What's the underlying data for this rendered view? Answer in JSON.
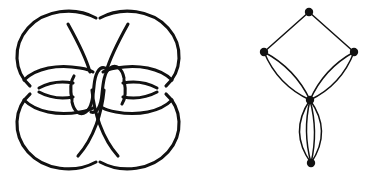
{
  "figure": {
    "background_color": "#ffffff",
    "stroke_color": "#111111",
    "width": 382,
    "height": 180
  },
  "knot_panel": {
    "label": "knot-diagram",
    "description": "Alternating knot projection with four outer lobes, two horizontal lens arcs and a central S-curve",
    "line_width": 3.1,
    "crossing_count": 10,
    "components": [
      {
        "name": "top-left-lobe",
        "type": "arc"
      },
      {
        "name": "top-right-lobe",
        "type": "arc"
      },
      {
        "name": "bottom-left-lobe",
        "type": "arc"
      },
      {
        "name": "bottom-right-lobe",
        "type": "arc"
      },
      {
        "name": "left-lens",
        "type": "lens"
      },
      {
        "name": "right-lens",
        "type": "lens"
      },
      {
        "name": "center-s-curve",
        "type": "clasp"
      }
    ]
  },
  "graph_panel": {
    "label": "planar-graph",
    "description": "Five-vertex multigraph: diamond of four vertices over a bottom vertex joined by four parallel edges",
    "node_radius": 4.2,
    "edge_width": 1.5,
    "nodes": [
      {
        "id": "top",
        "name": "node-top",
        "x": 114,
        "y": 12,
        "label": ""
      },
      {
        "id": "left",
        "name": "node-left",
        "x": 69,
        "y": 52,
        "label": ""
      },
      {
        "id": "right",
        "name": "node-right",
        "x": 159,
        "y": 52,
        "label": ""
      },
      {
        "id": "center",
        "name": "node-center",
        "x": 115,
        "y": 100,
        "label": ""
      },
      {
        "id": "bottom",
        "name": "node-bottom",
        "x": 116,
        "y": 163,
        "label": ""
      }
    ],
    "edges": [
      {
        "from": "top",
        "to": "left",
        "curvature": 0,
        "name": "edge-top-left"
      },
      {
        "from": "top",
        "to": "right",
        "curvature": 0,
        "name": "edge-top-right"
      },
      {
        "from": "left",
        "to": "center",
        "curvature": 13,
        "name": "edge-left-center-outer"
      },
      {
        "from": "left",
        "to": "center",
        "curvature": -11,
        "name": "edge-left-center-inner"
      },
      {
        "from": "right",
        "to": "center",
        "curvature": -13,
        "name": "edge-right-center-outer"
      },
      {
        "from": "right",
        "to": "center",
        "curvature": 11,
        "name": "edge-right-center-inner"
      },
      {
        "from": "center",
        "to": "bottom",
        "curvature": 22,
        "name": "edge-center-bottom-1"
      },
      {
        "from": "center",
        "to": "bottom",
        "curvature": 8,
        "name": "edge-center-bottom-2"
      },
      {
        "from": "center",
        "to": "bottom",
        "curvature": -8,
        "name": "edge-center-bottom-3"
      },
      {
        "from": "center",
        "to": "bottom",
        "curvature": -22,
        "name": "edge-center-bottom-4"
      }
    ]
  }
}
